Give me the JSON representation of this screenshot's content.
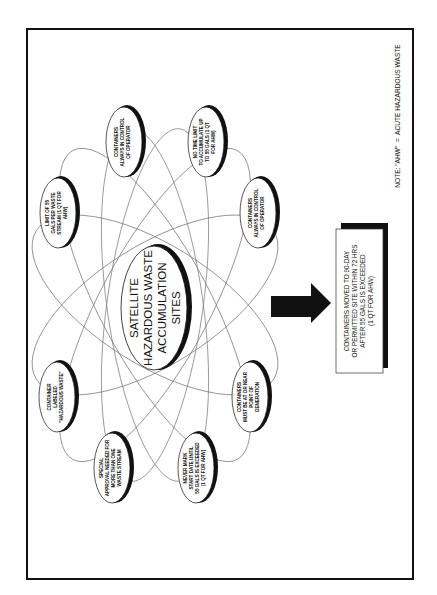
{
  "diagram": {
    "title_lines": [
      "SATELLITE",
      "HAZARDOUS WASTE",
      "ACCUMULATION",
      "SITES"
    ],
    "nodes": [
      {
        "id": "limit-55",
        "lines": [
          "LIMIT OF 55",
          "GALS PER WASTE",
          "STREAM (1 QT FOR",
          "AHW)"
        ]
      },
      {
        "id": "containers-control-1",
        "lines": [
          "CONTAINERS",
          "ALWAYS IN CONTROL",
          "OF OPERATOR"
        ]
      },
      {
        "id": "no-time-limit",
        "lines": [
          "NO TIME LIMIT",
          "TO ACCUMULATE UP",
          "TO 55 GALS (1 QT",
          "FOR AHW)"
        ]
      },
      {
        "id": "containers-control-2",
        "lines": [
          "CONTAINERS",
          "ALWAYS IN CONTROL",
          "OF OPERATOR"
        ]
      },
      {
        "id": "container-labeled",
        "lines": [
          "CONTAINER",
          "LABELED",
          "\"HAZARDOUS WASTE\""
        ]
      },
      {
        "id": "special-approval",
        "lines": [
          "SPECIAL",
          "APPROVAL NEEDED FOR",
          "MORE THAN ONE",
          "WASTE STREAM"
        ]
      },
      {
        "id": "never-mark",
        "lines": [
          "NEVER MARK",
          "START DATE UNTIL",
          "55 GALS IS EXCEEDED",
          "(1 QT FOR AHW)"
        ]
      },
      {
        "id": "containers-near",
        "lines": [
          "CONTAINERS",
          "MUST BE AT OR NEAR",
          "POINT OF",
          "GENERATION"
        ]
      }
    ],
    "outcome_box": {
      "lines": [
        "CONTAINERS MOVED TO 90-DAY",
        "OR PERMITTED SITE WITHIN 72 HRS",
        "AFTER 55 GALS IS EXCEEDED",
        "(1 QT FOR AHW)"
      ]
    },
    "note": "NOTE: \"AHW\"  =  ACUTE HAZARDOUS WASTE",
    "colors": {
      "ink": "#111111",
      "paper": "#ffffff",
      "orbit": "#777777"
    }
  }
}
